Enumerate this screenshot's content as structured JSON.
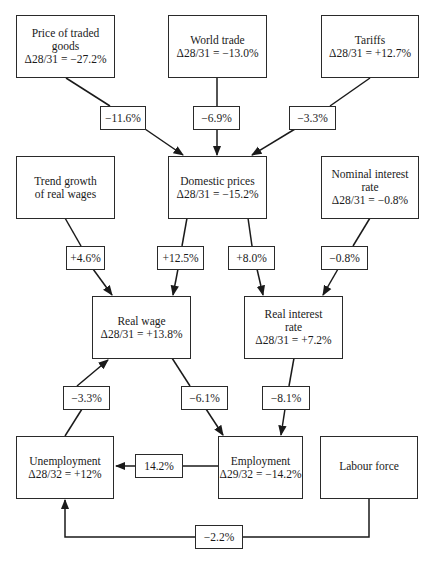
{
  "nodes": {
    "price_traded": {
      "title": "Price of traded goods",
      "value": "Δ28/31 = −27.2%"
    },
    "world_trade": {
      "title": "World trade",
      "value": "Δ28/31 = −13.0%"
    },
    "tariffs": {
      "title": "Tariffs",
      "value": "Δ28/31 = +12.7%"
    },
    "trend_growth": {
      "title": "Trend growth of real wages",
      "value": ""
    },
    "domestic_prices": {
      "title": "Domestic prices",
      "value": "Δ28/31 = −15.2%"
    },
    "nominal_interest": {
      "title": "Nominal interest rate",
      "value": "Δ28/31 = −0.8%"
    },
    "real_wage": {
      "title": "Real wage",
      "value": "Δ28/31 = +13.8%"
    },
    "real_interest": {
      "title": "Real interest rate",
      "value": "Δ28/31 = +7.2%"
    },
    "unemployment": {
      "title": "Unemployment",
      "value": "Δ28/32 = +12%"
    },
    "employment": {
      "title": "Employment",
      "value": "Δ29/32 = −14.2%"
    },
    "labour_force": {
      "title": "Labour force",
      "value": ""
    }
  },
  "edges": {
    "price_to_domestic": "−11.6%",
    "world_to_domestic": "−6.9%",
    "tariffs_to_domestic": "−3.3%",
    "trend_to_realwage": "+4.6%",
    "domestic_to_realwage": "+12.5%",
    "domestic_to_realinterest": "+8.0%",
    "nominal_to_realinterest": "−0.8%",
    "realwage_to_unemployment": "−3.3%",
    "realwage_to_employment": "−6.1%",
    "realinterest_to_employment": "−8.1%",
    "employment_to_unemployment": "14.2%",
    "labour_to_unemployment": "−2.2%"
  }
}
